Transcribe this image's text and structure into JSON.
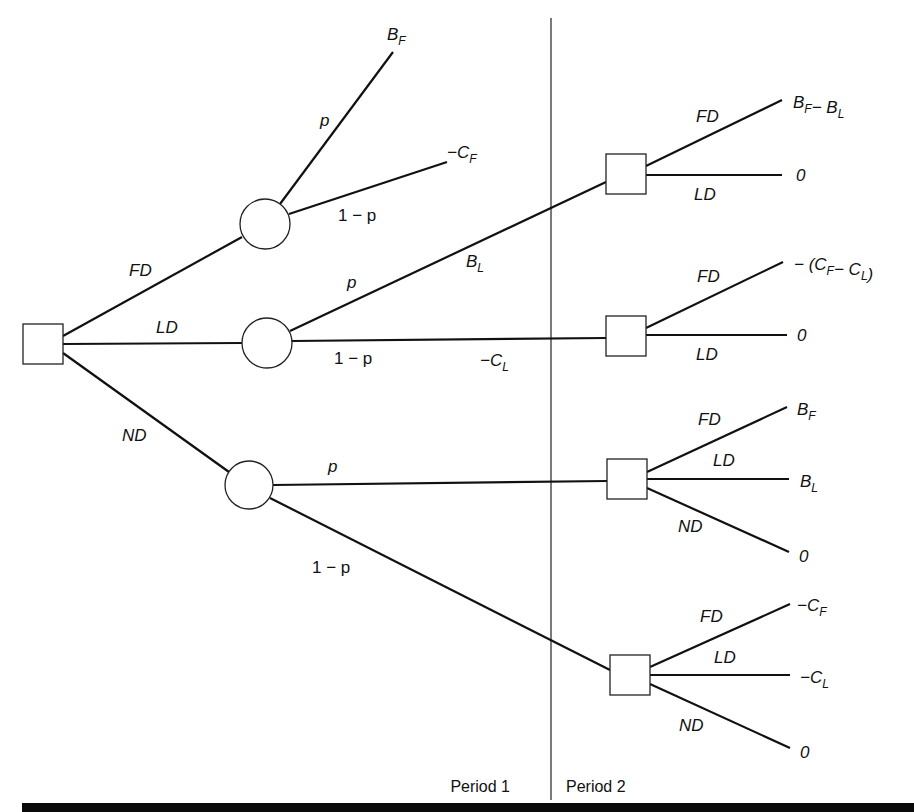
{
  "diagram": {
    "type": "decision-tree",
    "periods": [
      {
        "label": "Period 1",
        "x": 510,
        "y": 792
      },
      {
        "label": "Period 2",
        "x": 566,
        "y": 792
      }
    ],
    "divider": {
      "x": 551,
      "y1": 18,
      "y2": 800
    },
    "nodes": [
      {
        "id": "root",
        "kind": "decision",
        "x": 43,
        "y": 344,
        "size": 40
      },
      {
        "id": "c_fd",
        "kind": "chance",
        "x": 265,
        "y": 224,
        "r": 25
      },
      {
        "id": "c_ld",
        "kind": "chance",
        "x": 267,
        "y": 343,
        "r": 25
      },
      {
        "id": "c_nd",
        "kind": "chance",
        "x": 249,
        "y": 485,
        "r": 24
      },
      {
        "id": "d_ld_p",
        "kind": "decision",
        "x": 626,
        "y": 174,
        "size": 40
      },
      {
        "id": "d_ld_1mp",
        "kind": "decision",
        "x": 626,
        "y": 336,
        "size": 40
      },
      {
        "id": "d_nd_p",
        "kind": "decision",
        "x": 627,
        "y": 479,
        "size": 40
      },
      {
        "id": "d_nd_1mp",
        "kind": "decision",
        "x": 630,
        "y": 675,
        "size": 40
      }
    ],
    "edges": [
      {
        "x1": 63,
        "y1": 336,
        "x2": 242,
        "y2": 237
      },
      {
        "x1": 63,
        "y1": 344,
        "x2": 242,
        "y2": 343
      },
      {
        "x1": 63,
        "y1": 353,
        "x2": 229,
        "y2": 472
      },
      {
        "x1": 280,
        "y1": 204,
        "x2": 393,
        "y2": 52
      },
      {
        "x1": 289,
        "y1": 214,
        "x2": 447,
        "y2": 162
      },
      {
        "x1": 290,
        "y1": 331,
        "x2": 606,
        "y2": 182
      },
      {
        "x1": 292,
        "y1": 341,
        "x2": 606,
        "y2": 338
      },
      {
        "x1": 273,
        "y1": 485,
        "x2": 607,
        "y2": 481
      },
      {
        "x1": 270,
        "y1": 498,
        "x2": 610,
        "y2": 670
      },
      {
        "x1": 646,
        "y1": 166,
        "x2": 782,
        "y2": 100
      },
      {
        "x1": 646,
        "y1": 175,
        "x2": 782,
        "y2": 175
      },
      {
        "x1": 646,
        "y1": 328,
        "x2": 783,
        "y2": 262
      },
      {
        "x1": 646,
        "y1": 335,
        "x2": 787,
        "y2": 335
      },
      {
        "x1": 647,
        "y1": 472,
        "x2": 787,
        "y2": 407
      },
      {
        "x1": 647,
        "y1": 479,
        "x2": 789,
        "y2": 479
      },
      {
        "x1": 647,
        "y1": 488,
        "x2": 789,
        "y2": 552
      },
      {
        "x1": 650,
        "y1": 667,
        "x2": 790,
        "y2": 604
      },
      {
        "x1": 650,
        "y1": 675,
        "x2": 790,
        "y2": 675
      },
      {
        "x1": 650,
        "y1": 684,
        "x2": 790,
        "y2": 748
      }
    ],
    "edge_labels": [
      {
        "text": "FD",
        "x": 129,
        "y": 276,
        "italic": true
      },
      {
        "text": "LD",
        "x": 156,
        "y": 333,
        "italic": true
      },
      {
        "text": "ND",
        "x": 122,
        "y": 441,
        "italic": true
      },
      {
        "text": "p",
        "x": 320,
        "y": 126,
        "italic": true
      },
      {
        "text": "1 − p",
        "x": 338,
        "y": 221,
        "italic": false
      },
      {
        "text": "p",
        "x": 347,
        "y": 288,
        "italic": true
      },
      {
        "text": "1 − p",
        "x": 334,
        "y": 364,
        "italic": false
      },
      {
        "text": "p",
        "x": 328,
        "y": 472,
        "italic": true
      },
      {
        "text": "1 − p",
        "x": 312,
        "y": 573,
        "italic": false
      },
      {
        "text": "FD",
        "x": 696,
        "y": 122,
        "italic": true
      },
      {
        "text": "LD",
        "x": 694,
        "y": 200,
        "italic": true
      },
      {
        "text": "FD",
        "x": 697,
        "y": 282,
        "italic": true
      },
      {
        "text": "LD",
        "x": 696,
        "y": 360,
        "italic": true
      },
      {
        "text": "FD",
        "x": 698,
        "y": 425,
        "italic": true
      },
      {
        "text": "LD",
        "x": 713,
        "y": 466,
        "italic": true
      },
      {
        "text": "ND",
        "x": 678,
        "y": 532,
        "italic": true
      },
      {
        "text": "FD",
        "x": 700,
        "y": 622,
        "italic": true
      },
      {
        "text": "LD",
        "x": 714,
        "y": 663,
        "italic": true
      },
      {
        "text": "ND",
        "x": 679,
        "y": 731,
        "italic": true
      }
    ],
    "payoffs": [
      {
        "id": "p1",
        "x": 387,
        "y": 40,
        "parts": [
          {
            "t": "B",
            "s": "F"
          }
        ]
      },
      {
        "id": "p2",
        "x": 447,
        "y": 158,
        "parts": [
          {
            "t": "−C",
            "s": "F"
          }
        ]
      },
      {
        "id": "p3",
        "x": 466,
        "y": 267,
        "parts": [
          {
            "t": "B",
            "s": "L"
          }
        ]
      },
      {
        "id": "p4",
        "x": 480,
        "y": 366,
        "parts": [
          {
            "t": "−C",
            "s": "L"
          }
        ]
      },
      {
        "id": "p5",
        "x": 793,
        "y": 108,
        "parts": [
          {
            "t": "B",
            "s": "F"
          },
          {
            "t": "− B",
            "s": "L"
          }
        ]
      },
      {
        "id": "p6",
        "x": 796,
        "y": 181,
        "parts": [
          {
            "t": "0",
            "s": ""
          }
        ]
      },
      {
        "id": "p7",
        "x": 794,
        "y": 270,
        "parts": [
          {
            "t": "− (C",
            "s": "F"
          },
          {
            "t": "− C",
            "s": "L"
          },
          {
            "t": ")",
            "s": ""
          }
        ]
      },
      {
        "id": "p8",
        "x": 797,
        "y": 341,
        "parts": [
          {
            "t": "0",
            "s": ""
          }
        ]
      },
      {
        "id": "p9",
        "x": 797,
        "y": 415,
        "parts": [
          {
            "t": "B",
            "s": "F"
          }
        ]
      },
      {
        "id": "p10",
        "x": 800,
        "y": 487,
        "parts": [
          {
            "t": "B",
            "s": "L"
          }
        ]
      },
      {
        "id": "p11",
        "x": 799,
        "y": 562,
        "parts": [
          {
            "t": "0",
            "s": ""
          }
        ]
      },
      {
        "id": "p12",
        "x": 797,
        "y": 611,
        "parts": [
          {
            "t": "−C",
            "s": "F"
          }
        ]
      },
      {
        "id": "p13",
        "x": 800,
        "y": 683,
        "parts": [
          {
            "t": "−C",
            "s": "L"
          }
        ]
      },
      {
        "id": "p14",
        "x": 800,
        "y": 758,
        "parts": [
          {
            "t": "0",
            "s": ""
          }
        ]
      }
    ],
    "bottom_bar": {
      "y": 803,
      "height": 9,
      "x1": 22,
      "x2": 914,
      "color": "#0a0a0a"
    }
  }
}
